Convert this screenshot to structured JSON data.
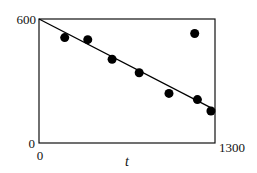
{
  "chart_data": {
    "type": "scatter",
    "title": "",
    "xlabel": "t",
    "ylabel": "",
    "xlim": [
      0,
      1300
    ],
    "ylim": [
      0,
      600
    ],
    "x_ticks": [
      {
        "value": 0,
        "label": "0"
      },
      {
        "value": 1300,
        "label": "1300"
      }
    ],
    "y_ticks": [
      {
        "value": 0,
        "label": "0"
      },
      {
        "value": 600,
        "label": "600"
      }
    ],
    "grid": false,
    "legend": null,
    "series": [
      {
        "name": "data points",
        "marker": "filled-circle",
        "color": "#000000",
        "points": [
          {
            "x": 190,
            "y": 510
          },
          {
            "x": 360,
            "y": 500
          },
          {
            "x": 540,
            "y": 405
          },
          {
            "x": 740,
            "y": 340
          },
          {
            "x": 960,
            "y": 240
          },
          {
            "x": 1170,
            "y": 210
          },
          {
            "x": 1270,
            "y": 155
          },
          {
            "x": 1150,
            "y": 530
          }
        ]
      },
      {
        "name": "fit line",
        "type": "line",
        "color": "#000000",
        "points": [
          {
            "x": 0,
            "y": 600
          },
          {
            "x": 1300,
            "y": 160
          }
        ]
      }
    ]
  },
  "labels": {
    "x_axis_title": "t",
    "x_min": "0",
    "x_max": "1300",
    "y_min": "0",
    "y_max": "600"
  },
  "layout": {
    "plot_left": 39,
    "plot_top": 19,
    "plot_right": 215,
    "plot_bottom": 143,
    "marker_radius": 4.5
  }
}
